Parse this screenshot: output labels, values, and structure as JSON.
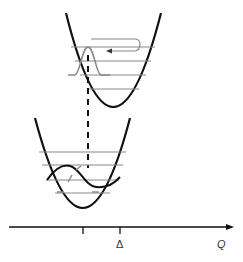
{
  "diagram": {
    "type": "configuration-coordinate-diagram",
    "upper_well": {
      "vibrational_levels": 4,
      "wavefunction": "gaussian",
      "relaxation_arrow": "curved-left-arrow"
    },
    "lower_well": {
      "vibrational_levels": 4,
      "wavefunction": "oscillatory"
    },
    "transition": "vertical-dashed-line",
    "axis": {
      "label": "Q",
      "tick_labels": [
        "",
        "Δ"
      ]
    },
    "colors": {
      "curve": "#111111",
      "level": "#777777",
      "wavefunction": "#888888"
    }
  }
}
